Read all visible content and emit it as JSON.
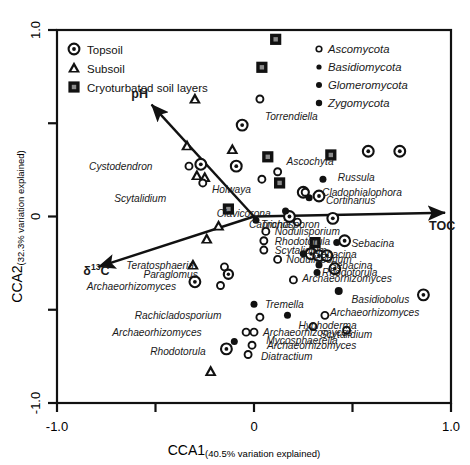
{
  "chart_data": {
    "type": "scatter",
    "title": "",
    "xlabel": "CCA1",
    "xlabel_sub": "(40.5% variation explained)",
    "ylabel": "CCA2",
    "ylabel_sub": "(32.3% variation explained)",
    "xlim": [
      -1.0,
      1.0
    ],
    "ylim": [
      -1.0,
      1.0
    ],
    "xticks": [
      "-1.0",
      "0",
      "1.0"
    ],
    "yticks": [
      "1.0",
      "0",
      "-1.0"
    ],
    "grid": false,
    "legend_position": "top-left and top-right inside plot",
    "sample_legend": {
      "items": [
        {
          "label": "Topsoil",
          "symbol": "circle-dot"
        },
        {
          "label": "Subsoil",
          "symbol": "triangle-filled"
        },
        {
          "label": "Cryoturbated soil layers",
          "symbol": "square-filled"
        }
      ]
    },
    "phylum_legend": {
      "items": [
        {
          "label": "Ascomycota",
          "symbol": "dot-open"
        },
        {
          "label": "Basidiomycota",
          "symbol": "dot-filled-small"
        },
        {
          "label": "Glomeromycota",
          "symbol": "dot-filled-mid"
        },
        {
          "label": "Zygomycota",
          "symbol": "dot-filled-large"
        }
      ]
    },
    "vectors": [
      {
        "name": "pH",
        "x": -0.52,
        "y": 0.6,
        "label": "pH"
      },
      {
        "name": "TOC",
        "x": 0.97,
        "y": 0.02,
        "label": "TOC"
      },
      {
        "name": "d13C",
        "x": -0.79,
        "y": -0.27,
        "label": "δ¹³C"
      }
    ],
    "samples": [
      {
        "type": "cryoturbated",
        "x": 0.11,
        "y": 0.95
      },
      {
        "type": "cryoturbated",
        "x": 0.04,
        "y": 0.8
      },
      {
        "type": "cryoturbated",
        "x": 0.07,
        "y": 0.32
      },
      {
        "type": "cryoturbated",
        "x": 0.39,
        "y": 0.33
      },
      {
        "type": "cryoturbated",
        "x": 0.13,
        "y": 0.18
      },
      {
        "type": "cryoturbated",
        "x": -0.13,
        "y": 0.04
      },
      {
        "type": "cryoturbated",
        "x": 0.31,
        "y": -0.14
      },
      {
        "type": "subsoil",
        "x": -0.3,
        "y": 0.63
      },
      {
        "type": "subsoil",
        "x": -0.11,
        "y": 0.36
      },
      {
        "type": "subsoil",
        "x": -0.34,
        "y": 0.38
      },
      {
        "type": "subsoil",
        "x": -0.29,
        "y": 0.22
      },
      {
        "type": "subsoil",
        "x": -0.25,
        "y": 0.21
      },
      {
        "type": "subsoil",
        "x": -0.18,
        "y": -0.05
      },
      {
        "type": "subsoil",
        "x": -0.24,
        "y": -0.12
      },
      {
        "type": "subsoil",
        "x": -0.31,
        "y": -0.26
      },
      {
        "type": "subsoil",
        "x": -0.22,
        "y": -0.83
      },
      {
        "type": "topsoil",
        "x": -0.06,
        "y": 0.49
      },
      {
        "type": "topsoil",
        "x": -0.27,
        "y": 0.28
      },
      {
        "type": "topsoil",
        "x": -0.09,
        "y": 0.27
      },
      {
        "type": "topsoil",
        "x": 0.25,
        "y": 0.13
      },
      {
        "type": "topsoil",
        "x": 0.33,
        "y": 0.11
      },
      {
        "type": "topsoil",
        "x": 0.58,
        "y": 0.35
      },
      {
        "type": "topsoil",
        "x": 0.74,
        "y": 0.35
      },
      {
        "type": "topsoil",
        "x": 0.18,
        "y": 0.0
      },
      {
        "type": "topsoil",
        "x": 0.4,
        "y": -0.01
      },
      {
        "type": "topsoil",
        "x": 0.46,
        "y": -0.13
      },
      {
        "type": "topsoil",
        "x": 0.29,
        "y": -0.2
      },
      {
        "type": "topsoil",
        "x": 0.33,
        "y": -0.21
      },
      {
        "type": "topsoil",
        "x": 0.37,
        "y": -0.21
      },
      {
        "type": "topsoil",
        "x": 0.41,
        "y": -0.28
      },
      {
        "type": "topsoil",
        "x": 0.86,
        "y": -0.42
      },
      {
        "type": "topsoil",
        "x": -0.14,
        "y": -0.71
      },
      {
        "type": "topsoil",
        "x": -0.3,
        "y": -0.35
      }
    ],
    "taxa": [
      {
        "name": "Torrendiella",
        "phylum": "Ascomycota",
        "x": 0.03,
        "y": 0.63,
        "lx": 0.03,
        "ly": 0.54
      },
      {
        "name": "Ascochyta",
        "phylum": "Ascomycota",
        "x": 0.12,
        "y": 0.24,
        "lx": 0.14,
        "ly": 0.3
      },
      {
        "name": "Cystodendron",
        "phylum": "Ascomycota",
        "x": -0.33,
        "y": 0.27,
        "lx": -0.49,
        "ly": 0.27
      },
      {
        "name": "Holwaya",
        "phylum": "Ascomycota",
        "x": 0.04,
        "y": 0.2,
        "lx": 0.01,
        "ly": 0.15
      },
      {
        "name": "Scytalidium",
        "phylum": "Ascomycota",
        "x": -0.26,
        "y": 0.18,
        "lx": -0.42,
        "ly": 0.1
      },
      {
        "name": "Cladophialophora",
        "phylum": "Ascomycota",
        "x": 0.26,
        "y": 0.13,
        "lx": 0.32,
        "ly": 0.13
      },
      {
        "name": "Russula",
        "phylum": "Basidiomycota",
        "x": 0.35,
        "y": 0.2,
        "lx": 0.4,
        "ly": 0.21
      },
      {
        "name": "Cortinarius",
        "phylum": "Basidiomycota",
        "x": 0.28,
        "y": 0.1,
        "lx": 0.34,
        "ly": 0.09
      },
      {
        "name": "Clavicorona",
        "phylum": "Basidiomycota",
        "x": 0.16,
        "y": 0.03,
        "lx": 0.11,
        "ly": 0.02
      },
      {
        "name": "Trichosporon",
        "phylum": "Basidiomycota",
        "x": 0.01,
        "y": -0.02,
        "lx": 0.01,
        "ly": -0.04
      },
      {
        "name": "Capronia",
        "phylum": "Ascomycota",
        "x": 0.22,
        "y": -0.03,
        "lx": 0.21,
        "ly": -0.04
      },
      {
        "name": "Nodulisporium",
        "phylum": "Ascomycota",
        "x": 0.06,
        "y": -0.08,
        "lx": 0.08,
        "ly": -0.08
      },
      {
        "name": "Rhodotorula",
        "phylum": "Ascomycota",
        "x": 0.05,
        "y": -0.13,
        "lx": 0.08,
        "ly": -0.13
      },
      {
        "name": "Scytalidium",
        "phylum": "Ascomycota",
        "x": 0.05,
        "y": -0.18,
        "lx": 0.08,
        "ly": -0.18
      },
      {
        "name": "Nodulisporium",
        "phylum": "Ascomycota",
        "x": 0.12,
        "y": -0.23,
        "lx": 0.14,
        "ly": -0.23
      },
      {
        "name": "Sebacina",
        "phylum": "Basidiomycota",
        "x": 0.42,
        "y": -0.14,
        "lx": 0.47,
        "ly": -0.14
      },
      {
        "name": "Sebacina",
        "phylum": "Basidiomycota",
        "x": 0.25,
        "y": -0.2,
        "lx": 0.28,
        "ly": -0.2
      },
      {
        "name": "Sebacina",
        "phylum": "Basidiomycota",
        "x": 0.33,
        "y": -0.26,
        "lx": 0.36,
        "ly": -0.26
      },
      {
        "name": "Rhodotorula",
        "phylum": "Basidiomycota",
        "x": 0.32,
        "y": -0.3,
        "lx": 0.32,
        "ly": -0.3
      },
      {
        "name": "Basidiobolus",
        "phylum": "Zygomycota",
        "x": 0.43,
        "y": -0.4,
        "lx": 0.47,
        "ly": -0.44
      },
      {
        "name": "Teratosphaeria",
        "phylum": "Ascomycota",
        "x": -0.15,
        "y": -0.27,
        "lx": -0.28,
        "ly": -0.26
      },
      {
        "name": "Paraglomus",
        "phylum": "Glomeromycota",
        "x": -0.13,
        "y": -0.31,
        "lx": -0.26,
        "ly": -0.31
      },
      {
        "name": "Archaeorhizomyces",
        "phylum": "Ascomycota",
        "x": -0.17,
        "y": -0.37,
        "lx": -0.37,
        "ly": -0.37
      },
      {
        "name": "Archaeorhizomyces",
        "phylum": "Ascomycota",
        "x": 0.2,
        "y": -0.34,
        "lx": 0.22,
        "ly": -0.33
      },
      {
        "name": "Tremella",
        "phylum": "Basidiomycota",
        "x": 0.0,
        "y": -0.47,
        "lx": 0.03,
        "ly": -0.47
      },
      {
        "name": "Rachicladosporium",
        "phylum": "Ascomycota",
        "x": 0.03,
        "y": -0.54,
        "lx": -0.14,
        "ly": -0.53
      },
      {
        "name": "Hyphoderma",
        "phylum": "Basidiomycota",
        "x": 0.17,
        "y": -0.53,
        "lx": 0.2,
        "ly": -0.58
      },
      {
        "name": "Archaeorhizomyces",
        "phylum": "Ascomycota",
        "x": 0.36,
        "y": -0.53,
        "lx": 0.36,
        "ly": -0.51
      },
      {
        "name": "Archaeorhizomyces",
        "phylum": "Ascomycota",
        "x": -0.04,
        "y": -0.62,
        "lx": -0.24,
        "ly": -0.62
      },
      {
        "name": "Archaeorhizomyces",
        "phylum": "Ascomycota",
        "x": 0.0,
        "y": -0.62,
        "lx": 0.02,
        "ly": -0.62
      },
      {
        "name": "Scytalidium",
        "phylum": "Ascomycota",
        "x": 0.3,
        "y": -0.59,
        "lx": 0.31,
        "ly": -0.63
      },
      {
        "name": "Mycosphaerella",
        "phylum": "Ascomycota",
        "x": 0.47,
        "y": -0.61,
        "lx": 0.45,
        "ly": -0.66
      },
      {
        "name": "Archaeorhizomyces",
        "phylum": "Ascomycota",
        "x": -0.01,
        "y": -0.69,
        "lx": 0.04,
        "ly": -0.69
      },
      {
        "name": "Rhodotorula",
        "phylum": "Basidiomycota",
        "x": -0.1,
        "y": -0.67,
        "lx": -0.22,
        "ly": -0.72
      },
      {
        "name": "Diatractium",
        "phylum": "Ascomycota",
        "x": -0.03,
        "y": -0.74,
        "lx": 0.01,
        "ly": -0.75
      }
    ]
  }
}
